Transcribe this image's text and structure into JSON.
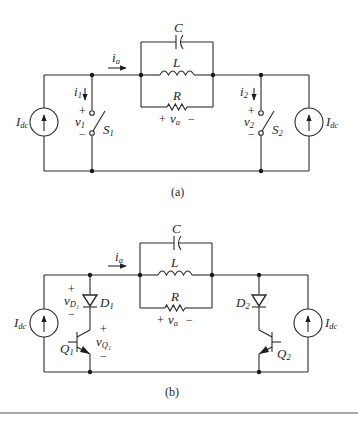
{
  "figure": {
    "circuits": [
      {
        "id": "a",
        "caption": "(a)",
        "current_label": "i",
        "current_sub": "a",
        "load": {
          "capacitor": "C",
          "inductor": "L",
          "resistor": "R",
          "voltage_plus": "+",
          "voltage_label": "v",
          "voltage_sub": "a",
          "voltage_minus": "−"
        },
        "left_source": {
          "label": "I",
          "sub": "dc"
        },
        "right_source": {
          "label": "I",
          "sub": "dc"
        },
        "left_switch": {
          "name": "S",
          "sub": "1",
          "current": "i",
          "current_sub": "1",
          "voltage": "v",
          "voltage_sub": "1",
          "plus": "+",
          "minus": "−"
        },
        "right_switch": {
          "name": "S",
          "sub": "2",
          "current": "i",
          "current_sub": "2",
          "voltage": "v",
          "voltage_sub": "2",
          "plus": "+",
          "minus": "−"
        }
      },
      {
        "id": "b",
        "caption": "(b)",
        "current_label": "i",
        "current_sub": "a",
        "load": {
          "capacitor": "C",
          "inductor": "L",
          "resistor": "R",
          "voltage_plus": "+",
          "voltage_label": "v",
          "voltage_sub": "a",
          "voltage_minus": "−"
        },
        "left_source": {
          "label": "I",
          "sub": "dc"
        },
        "right_source": {
          "label": "I",
          "sub": "dc"
        },
        "left_leg": {
          "diode": "D",
          "diode_sub": "1",
          "diode_voltage": "v",
          "diode_voltage_sub": "D₁",
          "transistor": "Q",
          "transistor_sub": "1",
          "transistor_voltage": "v",
          "transistor_voltage_sub": "Q₁",
          "plus": "+",
          "minus": "−"
        },
        "right_leg": {
          "diode": "D",
          "diode_sub": "2",
          "transistor": "Q",
          "transistor_sub": "2"
        }
      }
    ]
  }
}
